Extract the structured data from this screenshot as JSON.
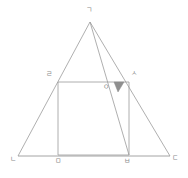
{
  "figure": {
    "kind": "geometry-diagram",
    "width": 188,
    "height": 178,
    "background_color": "#ffffff",
    "stroke_color": "#9a9a9a",
    "label_color": "#8c8c8c",
    "shade_color": "#8f8f8f"
  },
  "labels": {
    "apex": "ㄱ",
    "base_left": "ㄴ",
    "base_right": "ㄷ",
    "rect_top_left": "ㄹ",
    "rect_bottom_left": "ㅁ",
    "rect_bottom_right": "ㅂ",
    "rect_top_right": "ㅅ",
    "interior_point": "ㅇ"
  },
  "label_positions": {
    "apex": {
      "x": 86,
      "y": 6
    },
    "base_left": {
      "x": 10,
      "y": 158
    },
    "base_right": {
      "x": 172,
      "y": 157
    },
    "rect_top_left": {
      "x": 46,
      "y": 73
    },
    "rect_bottom_left": {
      "x": 58,
      "y": 159
    },
    "rect_bottom_right": {
      "x": 126,
      "y": 159
    },
    "rect_top_right": {
      "x": 131,
      "y": 72
    },
    "interior_point": {
      "x": 104,
      "y": 85
    }
  },
  "points": {
    "apex": {
      "x": 90,
      "y": 22
    },
    "base_left": {
      "x": 18,
      "y": 156
    },
    "base_right": {
      "x": 170,
      "y": 156
    },
    "rect_top_left": {
      "x": 58,
      "y": 82
    },
    "rect_top_right": {
      "x": 129,
      "y": 82
    },
    "rect_bottom_left": {
      "x": 58,
      "y": 155
    },
    "rect_bottom_right": {
      "x": 129,
      "y": 155
    },
    "interior_point": {
      "x": 112,
      "y": 86
    }
  },
  "shaded_triangle": {
    "p1": {
      "x": 114,
      "y": 82
    },
    "p2": {
      "x": 124,
      "y": 82
    },
    "p3": {
      "x": 118,
      "y": 92
    }
  }
}
